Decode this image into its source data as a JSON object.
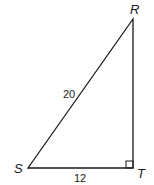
{
  "figure": {
    "type": "right-triangle",
    "vertices": [
      {
        "name": "R",
        "x": 133,
        "y": 19
      },
      {
        "name": "S",
        "x": 28,
        "y": 168
      },
      {
        "name": "T",
        "x": 133,
        "y": 168
      }
    ],
    "right_angle_at": "T",
    "labels": {
      "vertex_r": "R",
      "vertex_s": "S",
      "vertex_t": "T",
      "side_sr": "20",
      "side_st": "12"
    },
    "colors": {
      "stroke": "#1a1a1a",
      "background": "#ffffff"
    }
  }
}
